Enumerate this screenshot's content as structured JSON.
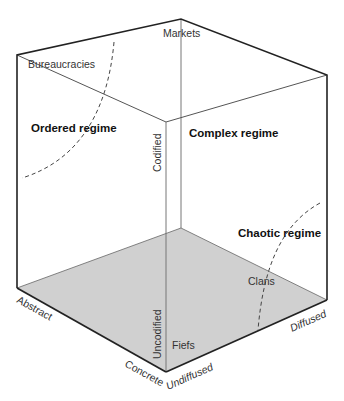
{
  "diagram": {
    "colors": {
      "floor": "#d0d0d0",
      "edge": "#222222",
      "inner_edge": "#777777",
      "text": "#333333"
    },
    "axes": {
      "codification": {
        "high": "Codified",
        "low": "Uncodified"
      },
      "abstraction": {
        "high": "Abstract",
        "low": "Concrete"
      },
      "diffusion": {
        "low": "Undiffused",
        "high": "Diffused"
      }
    },
    "institutions": {
      "bureaucracies": "Bureaucracies",
      "markets": "Markets",
      "clans": "Clans",
      "fiefs": "Fiefs"
    },
    "regimes": {
      "ordered": "Ordered regime",
      "complex": "Complex regime",
      "chaotic": "Chaotic regime"
    }
  }
}
